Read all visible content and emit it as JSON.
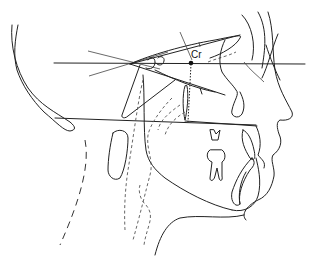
{
  "figure": {
    "type": "cephalometric tracing",
    "labels": {
      "cranial_point": "Cr"
    }
  }
}
